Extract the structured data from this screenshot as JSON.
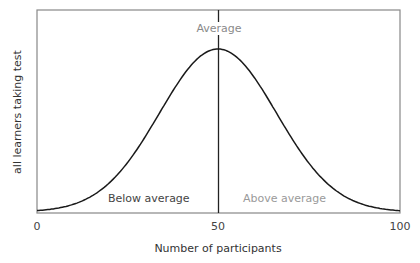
{
  "chart_data": {
    "type": "line",
    "title": "",
    "xlabel": "Number of participants",
    "ylabel": "all learners taking test",
    "xlim": [
      0,
      100
    ],
    "x_ticks": [
      "0",
      "50",
      "100"
    ],
    "grid": false,
    "legend": null,
    "series": [
      {
        "name": "Normal distribution (bell curve)",
        "x": [
          0,
          10,
          20,
          30,
          40,
          50,
          60,
          70,
          80,
          90,
          100
        ],
        "y": [
          0.0,
          0.06,
          0.25,
          0.6,
          0.92,
          1.0,
          0.92,
          0.6,
          0.25,
          0.06,
          0.0
        ]
      }
    ],
    "annotations": [
      {
        "text": "Average",
        "x": 50,
        "position": "top",
        "color": "#8a8a8a"
      },
      {
        "text": "Below average",
        "x": 25,
        "position": "bottom-left-region",
        "color": "#444444"
      },
      {
        "text": "Above average",
        "x": 75,
        "position": "bottom-right-region",
        "color": "#9a9a9a"
      }
    ],
    "reference_lines": [
      {
        "orientation": "vertical",
        "x": 50
      }
    ]
  },
  "labels": {
    "ylabel": "all learners taking test",
    "xlabel": "Number of participants",
    "tick0": "0",
    "tick50": "50",
    "tick100": "100",
    "average": "Average",
    "below": "Below average",
    "above": "Above average"
  },
  "colors": {
    "frame": "#888888",
    "curve": "#1a1a1a",
    "below": "#444444",
    "above": "#9a9a9a",
    "average": "#8a8a8a"
  }
}
